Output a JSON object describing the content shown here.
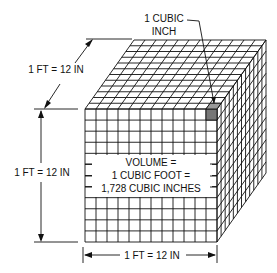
{
  "diagram": {
    "callout": {
      "line1": "1 CUBIC",
      "line2": "INCH"
    },
    "dim_depth": "1 FT = 12 IN",
    "dim_height": "1 FT = 12 IN",
    "dim_width": "1 FT = 12 IN",
    "volume_label": {
      "line1": "VOLUME =",
      "line2": "1 CUBIC FOOT =",
      "line3": "1,728 CUBIC INCHES"
    },
    "grid": {
      "rows": 12,
      "cols": 12,
      "depth": 12
    },
    "colors": {
      "line": "#111111",
      "highlight": "#777777",
      "background": "#ffffff"
    }
  }
}
